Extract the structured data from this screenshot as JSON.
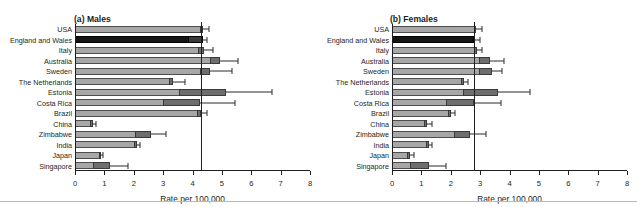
{
  "figure": {
    "clipped_top_text": "",
    "xlabel": "Rate per 100,000",
    "countries": [
      "USA",
      "England and  Wales",
      "Italy",
      "Australia",
      "Sweden",
      "The Netherlands",
      "Estonia",
      "Costa Rica",
      "Brazil",
      "China",
      "Zimbabwe",
      "India",
      "Japan",
      "Singapore"
    ],
    "tick_labels": [
      "0",
      "1",
      "2",
      "3",
      "4",
      "5",
      "6",
      "7",
      "8"
    ]
  },
  "chart_data": [
    {
      "type": "bar",
      "orientation": "horizontal",
      "title": "(a) Males",
      "panel": "a",
      "xlabel": "Rate per 100,000",
      "ylabel": "",
      "xlim": [
        0,
        8
      ],
      "ticks": [
        0,
        1,
        2,
        3,
        4,
        5,
        6,
        7,
        8
      ],
      "grid": false,
      "reference_line": 4.3,
      "highlight_country": "England and  Wales",
      "highlight_color": "#141414",
      "bar_color": "#a7a7a7",
      "segment_color": "#6e6e6e",
      "categories": [
        "USA",
        "England and  Wales",
        "Italy",
        "Australia",
        "Sweden",
        "The Netherlands",
        "Estonia",
        "Costa Rica",
        "Brazil",
        "China",
        "Zimbabwe",
        "India",
        "Japan",
        "Singapore"
      ],
      "values": [
        4.35,
        4.35,
        4.4,
        4.95,
        4.6,
        3.35,
        5.15,
        4.25,
        4.3,
        0.6,
        2.6,
        2.1,
        0.85,
        1.2
      ],
      "segment_start": [
        4.25,
        3.85,
        4.2,
        4.6,
        4.25,
        3.2,
        3.55,
        3.0,
        4.15,
        0.5,
        2.05,
        2.0,
        0.8,
        0.6
      ],
      "ci_low": [
        4.2,
        4.3,
        4.25,
        4.6,
        4.3,
        3.2,
        3.6,
        3.05,
        4.2,
        0.5,
        2.1,
        2.0,
        0.75,
        0.6
      ],
      "ci_high": [
        4.55,
        4.5,
        4.7,
        5.55,
        5.35,
        3.75,
        6.7,
        5.45,
        4.5,
        0.7,
        3.1,
        2.2,
        0.95,
        1.8
      ]
    },
    {
      "type": "bar",
      "orientation": "horizontal",
      "title": "(b) Females",
      "panel": "b",
      "xlabel": "Rate per 100,000",
      "ylabel": "",
      "xlim": [
        0,
        8
      ],
      "ticks": [
        0,
        1,
        2,
        3,
        4,
        5,
        6,
        7,
        8
      ],
      "grid": false,
      "reference_line": 2.8,
      "highlight_country": "England and  Wales",
      "highlight_color": "#141414",
      "bar_color": "#a7a7a7",
      "segment_color": "#6e6e6e",
      "categories": [
        "USA",
        "England and  Wales",
        "Italy",
        "Australia",
        "Sweden",
        "The Netherlands",
        "Estonia",
        "Costa Rica",
        "Brazil",
        "China",
        "Zimbabwe",
        "India",
        "Japan",
        "Singapore"
      ],
      "values": [
        2.85,
        2.8,
        2.9,
        3.35,
        3.4,
        2.45,
        3.6,
        2.8,
        2.0,
        1.2,
        2.65,
        1.25,
        0.6,
        1.25
      ],
      "segment_start": [
        2.8,
        2.75,
        2.8,
        2.95,
        2.95,
        2.35,
        2.4,
        1.85,
        1.9,
        1.1,
        2.1,
        1.15,
        0.5,
        0.6
      ],
      "ci_low": [
        2.8,
        2.8,
        2.85,
        3.0,
        3.0,
        2.4,
        2.45,
        1.9,
        1.95,
        1.15,
        2.15,
        1.2,
        0.55,
        0.6
      ],
      "ci_high": [
        3.05,
        3.0,
        3.05,
        3.8,
        3.75,
        2.6,
        4.7,
        3.7,
        2.15,
        1.35,
        3.2,
        1.35,
        0.75,
        1.85
      ]
    }
  ]
}
